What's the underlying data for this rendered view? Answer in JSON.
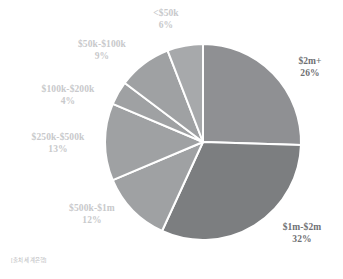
{
  "chart_data": {
    "type": "pie",
    "title": "",
    "subtitle": "",
    "xlabel": "",
    "ylabel": "",
    "grid": false,
    "legend_position": "none",
    "label_format": "category over percent",
    "start_angle_deg": 0,
    "direction": "clockwise",
    "categories": [
      "$2m+",
      "$1m-$2m",
      "$500k-$1m",
      "$250k-$500k",
      "$100k-$200k",
      "$50k-$100k",
      "<$50k"
    ],
    "values": [
      26,
      32,
      12,
      13,
      4,
      9,
      6
    ],
    "value_unit": "%",
    "total": 102,
    "slices": [
      {
        "label": "$2m+",
        "percent": "26%",
        "value": 26,
        "color": "#8f9093",
        "label_color": "#6f7073",
        "emphasis": "bold"
      },
      {
        "label": "$1m-$2m",
        "percent": "32%",
        "value": 32,
        "color": "#7c7e80",
        "label_color": "#6f7073",
        "emphasis": "bold"
      },
      {
        "label": "$500k-$1m",
        "percent": "12%",
        "value": 12,
        "color": "#9fa1a3",
        "label_color": "#c8c9cb",
        "emphasis": "normal"
      },
      {
        "label": "$250k-$500k",
        "percent": "13%",
        "value": 13,
        "color": "#9fa1a3",
        "label_color": "#c8c9cb",
        "emphasis": "normal"
      },
      {
        "label": "$100k-$200k",
        "percent": "4%",
        "value": 4,
        "color": "#9fa1a3",
        "label_color": "#c8c9cb",
        "emphasis": "normal"
      },
      {
        "label": "$50k-$100k",
        "percent": "9%",
        "value": 9,
        "color": "#9fa1a3",
        "label_color": "#c8c9cb",
        "emphasis": "normal"
      },
      {
        "label": "<$50k",
        "percent": "6%",
        "value": 6,
        "color": "#a7a9ab",
        "label_color": "#c8c9cb",
        "emphasis": "normal"
      }
    ]
  },
  "figure": {
    "background_color": "#ffffff",
    "divider_color": "#ffffff",
    "center_x": 203,
    "center_y": 142,
    "radius": 98
  },
  "source": {
    "note": "[출처 세계은행]"
  }
}
